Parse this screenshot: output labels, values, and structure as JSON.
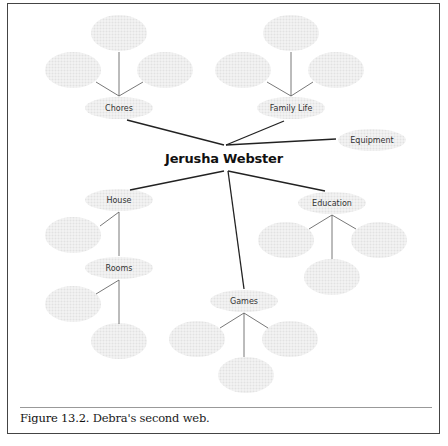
{
  "diagram": {
    "center": {
      "label": "Jerusha Webster"
    },
    "nodes": [
      {
        "id": "chores",
        "label": "Chores"
      },
      {
        "id": "family-life",
        "label": "Family Life"
      },
      {
        "id": "equipment",
        "label": "Equipment"
      },
      {
        "id": "house",
        "label": "House"
      },
      {
        "id": "rooms",
        "label": "Rooms"
      },
      {
        "id": "games",
        "label": "Games"
      },
      {
        "id": "education",
        "label": "Education"
      }
    ],
    "empty_node_color": "#ececec",
    "line_color": "#222222"
  },
  "caption": {
    "figure": "Figure 13.2.",
    "text": "Debra's second web."
  }
}
